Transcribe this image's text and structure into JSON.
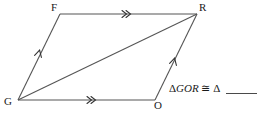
{
  "figure": {
    "type": "geometry-diagram",
    "shape": "parallelogram-with-diagonal",
    "vertices": [
      {
        "name": "F",
        "label": "F",
        "x": 60,
        "y": 14
      },
      {
        "name": "R",
        "label": "R",
        "x": 197,
        "y": 14
      },
      {
        "name": "O",
        "label": "O",
        "x": 155,
        "y": 100
      },
      {
        "name": "G",
        "label": "G",
        "x": 18,
        "y": 100
      }
    ],
    "segments": [
      {
        "name": "FR",
        "from": "F",
        "to": "R",
        "ticks": 2,
        "tick_style": "double-chevron"
      },
      {
        "name": "GO",
        "from": "G",
        "to": "O",
        "ticks": 2,
        "tick_style": "double-chevron"
      },
      {
        "name": "GF",
        "from": "G",
        "to": "F",
        "ticks": 1,
        "tick_style": "single-chevron"
      },
      {
        "name": "OR",
        "from": "O",
        "to": "R",
        "ticks": 1,
        "tick_style": "single-chevron"
      },
      {
        "name": "GR",
        "from": "G",
        "to": "R",
        "ticks": 0,
        "tick_style": "none"
      }
    ],
    "stroke_color": "#555555"
  },
  "statement": {
    "triangle_symbol": "Δ",
    "first_triangle": "GOR",
    "congruent_symbol": "≅",
    "full_text": "ΔGOR ≅ Δ ____",
    "blank_answer": ""
  }
}
